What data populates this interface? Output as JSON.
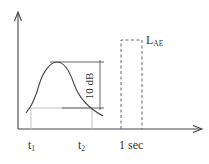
{
  "diagram": {
    "labels": {
      "t1_main": "t",
      "t1_sub": "1",
      "t2_main": "t",
      "t2_sub": "2",
      "one_sec": "1 sec",
      "lae_main": "L",
      "lae_sub": "AE",
      "ten_db": "10 dB"
    },
    "elements": {
      "y_axis": "vertical axis with arrow (sound level)",
      "x_axis": "horizontal axis with arrow (time)",
      "curve": "sound level event curve peaking between t1 and t2",
      "peak_line": "horizontal reference at peak level",
      "minus10_line": "horizontal reference 10 dB below peak",
      "ten_db_bracket": "vertical bracket spanning 10 dB",
      "t1_marker": "vertical guide at t1",
      "t2_marker": "vertical guide at t2",
      "lae_box": "dashed rectangle of 1 second duration representing equivalent level L_AE"
    },
    "colors": {
      "line": "#444444",
      "guide": "#bbbbbb",
      "dash": "#666666",
      "text": "#333333",
      "background": "#ffffff"
    }
  }
}
